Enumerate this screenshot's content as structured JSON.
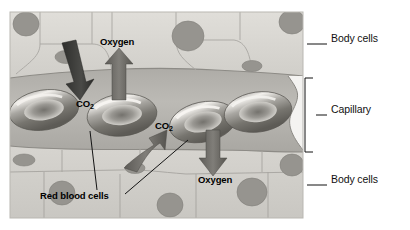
{
  "figure": {
    "title_cropped": "",
    "illustration": {
      "x": 10,
      "y": 12,
      "width": 293,
      "height": 206,
      "description": "Cross-section of body tissue with a capillary containing red blood cells, showing gas exchange"
    },
    "colors": {
      "tissue_light": "#d9d7d2",
      "tissue_mid": "#c6c4bf",
      "capillary_plasma": "#b5b3ae",
      "nucleus": "#8f8d88",
      "rbc_dark": "#6d6b67",
      "rbc_light": "#e8e6e2",
      "arrow_dark": "#3a3a38",
      "arrow_mid": "#6e6c68",
      "leader_line": "#1a1a1a",
      "background": "#ffffff"
    }
  },
  "callouts": {
    "right": [
      {
        "id": "body-cells-top",
        "label": "Body cells",
        "text_x": 331,
        "text_y": 39,
        "line_x1": 307,
        "line_y1": 44,
        "line_x2": 327,
        "line_y2": 44
      },
      {
        "id": "capillary",
        "label": "Capillary",
        "text_x": 331,
        "text_y": 110,
        "line_x1": 316,
        "line_y1": 115,
        "line_x2": 327,
        "line_y2": 115
      },
      {
        "id": "body-cells-bottom",
        "label": "Body cells",
        "text_x": 331,
        "text_y": 180,
        "line_x1": 307,
        "line_y1": 185,
        "line_x2": 327,
        "line_y2": 185
      }
    ],
    "bracket": {
      "id": "capillary-bracket",
      "x": 305,
      "y_top": 78,
      "y_bottom": 152,
      "arm": 8
    }
  },
  "annotations": [
    {
      "id": "oxygen-out",
      "label": "Oxygen",
      "x": 100,
      "y": 42
    },
    {
      "id": "co2-in",
      "label": "CO",
      "sub": "2",
      "x": 76,
      "y": 104
    },
    {
      "id": "co2-in-2",
      "label": "CO",
      "sub": "2",
      "x": 155,
      "y": 126
    },
    {
      "id": "oxygen-down",
      "label": "Oxygen",
      "x": 198,
      "y": 180
    },
    {
      "id": "red-blood-cells",
      "label": "Red blood cells",
      "x": 40,
      "y": 196
    }
  ],
  "leader_lines": [
    {
      "id": "rbc-leader-1",
      "x1": 97,
      "y1": 190,
      "x2": 90,
      "y2": 131
    },
    {
      "id": "rbc-leader-2",
      "x1": 125,
      "y1": 194,
      "x2": 188,
      "y2": 140
    }
  ],
  "arrows": [
    {
      "id": "co2-arrow-in-top",
      "direction": "down-right",
      "tone": "dark"
    },
    {
      "id": "oxygen-arrow-up",
      "direction": "up",
      "tone": "mid"
    },
    {
      "id": "co2-arrow-in-bottom",
      "direction": "up-right",
      "tone": "mid-dark"
    },
    {
      "id": "oxygen-arrow-down",
      "direction": "down",
      "tone": "mid"
    }
  ]
}
